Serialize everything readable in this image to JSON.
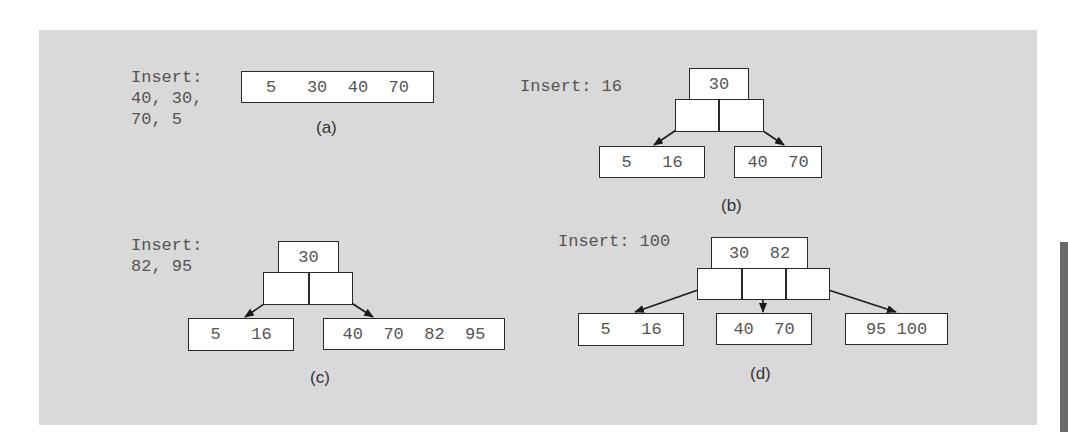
{
  "colors": {
    "panel_background": "#d9d9d9",
    "node_fill": "#ffffff",
    "node_border": "#2a2a2a",
    "text": "#555555",
    "side_bar": "#6a6a6a"
  },
  "diagrams": {
    "a": {
      "caption": "(a)",
      "insert_lines": [
        "Insert:",
        "40, 30,",
        "70, 5"
      ],
      "root": "5   30  40  70"
    },
    "b": {
      "caption": "(b)",
      "insert_lines": [
        "Insert: 16"
      ],
      "root": "30",
      "leaves": [
        "5   16",
        "40  70"
      ]
    },
    "c": {
      "caption": "(c)",
      "insert_lines": [
        "Insert:",
        "82, 95"
      ],
      "root": "30",
      "leaves": [
        "5   16",
        "40  70  82  95"
      ]
    },
    "d": {
      "caption": "(d)",
      "insert_lines": [
        "Insert: 100"
      ],
      "root": "30  82",
      "leaves": [
        "5   16",
        "40  70",
        "95 100"
      ]
    }
  }
}
